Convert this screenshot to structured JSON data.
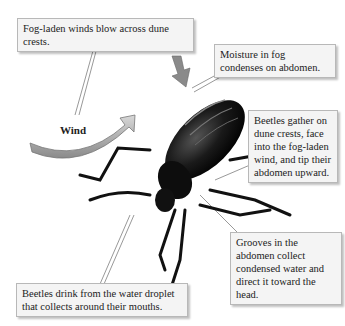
{
  "diagram": {
    "callouts": {
      "fog_winds": "Fog-laden winds blow across dune crests.",
      "moisture": "Moisture in fog condenses on abdomen.",
      "gather": "Beetles gather on dune crests, face into the fog-laden wind, and tip their abdomen upward.",
      "grooves": "Grooves in the abdomen collect condensed water and direct it toward the head.",
      "drink": "Beetles drink from the water droplet that collects around their mouths."
    },
    "wind_label": "Wind",
    "colors": {
      "arrow": "#9a9a9a",
      "callout_bg": "#f4f4f4",
      "callout_border": "#b8b8b8",
      "beetle": "#111111"
    }
  }
}
